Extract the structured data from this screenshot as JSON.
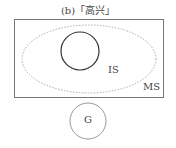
{
  "title": "(b)「高兴」",
  "labels": {
    "inner": "IS",
    "outer": "MS",
    "separate": "G"
  },
  "colors": {
    "box": "#777777",
    "ellipse": "#aaaaaa",
    "inner_circle": "#333333",
    "g_circle": "#999999",
    "text": "#444444"
  }
}
